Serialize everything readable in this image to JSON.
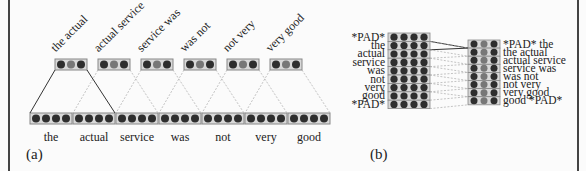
{
  "panel_a": {
    "caption": "(a)",
    "input_words": [
      "the",
      "actual",
      "service",
      "was",
      "not",
      "very",
      "good"
    ],
    "bigrams": [
      "the actual",
      "actual service",
      "service was",
      "was not",
      "not very",
      "very good"
    ],
    "input_vector_dims": 4,
    "bigram_vector_dims": 3
  },
  "panel_b": {
    "caption": "(b)",
    "input_rows": [
      "*PAD*",
      "the",
      "actual",
      "service",
      "was",
      "not",
      "very",
      "good",
      "*PAD*"
    ],
    "output_rows": [
      "*PAD* the",
      "the actual",
      "actual service",
      "service was",
      "was not",
      "not very",
      "very good",
      "good *PAD*"
    ],
    "input_vector_dims": 4,
    "output_vector_dims": 3
  },
  "colors": {
    "dot_dark": "#2e2e2e",
    "dot_mid": "#777777",
    "box_border": "#888888",
    "box_fill": "#d8d8d8",
    "frame": "#444444"
  }
}
